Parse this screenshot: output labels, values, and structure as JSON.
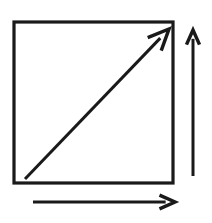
{
  "canvas": {
    "width": 212,
    "height": 223,
    "background_color": "#ffffff",
    "stroke_color": "#1a1a1a"
  },
  "figure": {
    "title": "",
    "type": "line-drawing"
  },
  "shapes": {
    "square": {
      "name": "square-outline",
      "x": 14,
      "y": 22,
      "width": 159,
      "height": 161,
      "stroke_width": 3.2,
      "fill": "none"
    },
    "diagonal_arrow": {
      "name": "diagonal-arrow",
      "direction": "up-right",
      "x1": 25,
      "y1": 179,
      "x2": 169,
      "y2": 29,
      "stroke_width": 3.0,
      "head_length": 23,
      "head_style": "open-chevron"
    },
    "vertical_arrow": {
      "name": "vertical-arrow",
      "direction": "up",
      "x1": 193,
      "y1": 176,
      "x2": 193,
      "y2": 30,
      "stroke_width": 3.0,
      "head_length": 16,
      "head_style": "open-chevron"
    },
    "horizontal_arrow": {
      "name": "horizontal-arrow",
      "direction": "right",
      "x1": 33,
      "y1": 202,
      "x2": 175,
      "y2": 202,
      "stroke_width": 3.0,
      "head_length": 17,
      "head_style": "open-chevron"
    }
  },
  "labels": []
}
